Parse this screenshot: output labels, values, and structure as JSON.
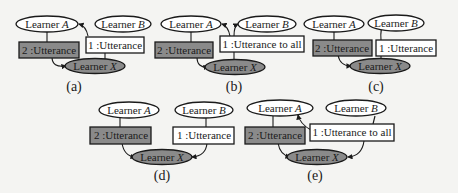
{
  "figure": {
    "labels": {
      "learner_a": "Learner ",
      "learner_a_italic": "A",
      "learner_b": "Learner ",
      "learner_b_italic": "B",
      "learner_x": "Learner ",
      "learner_x_italic": "X"
    },
    "panels": [
      {
        "id": "a",
        "caption": "(a)",
        "msg1": "1 :Utterance",
        "msg2": "2 :Utterance"
      },
      {
        "id": "b",
        "caption": "(b)",
        "msg1": "1 :Utterance to all",
        "msg2": "2 :Utterance"
      },
      {
        "id": "c",
        "caption": "(c)",
        "msg1": "1 :Utterance",
        "msg2": "2 :Utterance"
      },
      {
        "id": "d",
        "caption": "(d)",
        "msg1": "1 :Utterance",
        "msg2": "2 :Utterance"
      },
      {
        "id": "e",
        "caption": "(e)",
        "msg1": "1 :Utterance to all",
        "msg2": "2 :Utterance"
      }
    ],
    "colors": {
      "highlight_fill": "#8a8a8a",
      "plain_fill": "#ffffff",
      "stroke": "#1a1a1a"
    }
  }
}
